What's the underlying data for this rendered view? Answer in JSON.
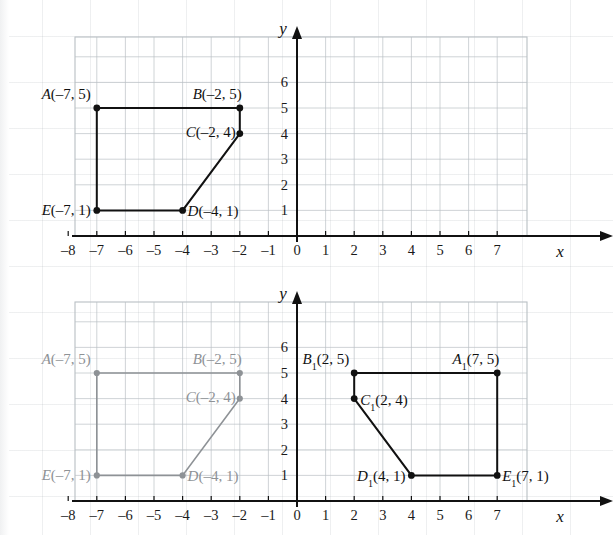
{
  "figure": {
    "kind": "coordinate-geometry-figure"
  },
  "chart_data": [
    {
      "id": "top-graph",
      "type": "scatter",
      "title": "",
      "xlabel": "x",
      "ylabel": "y",
      "xlim": [
        -8,
        7.6
      ],
      "ylim": [
        0,
        6.7
      ],
      "xticks": [
        "-8",
        "-7",
        "-6",
        "-5",
        "-4",
        "-3",
        "-2",
        "-1",
        "0",
        "1",
        "2",
        "3",
        "4",
        "5",
        "6",
        "7"
      ],
      "yticks": [
        "1",
        "2",
        "3",
        "4",
        "5",
        "6"
      ],
      "grid": true,
      "legend": "none",
      "series": [
        {
          "name": "pentagon-ABCDE",
          "color": "#111111",
          "closed": true,
          "points": [
            {
              "label": "A",
              "sub": "",
              "x": -7,
              "y": 5,
              "text": "A(–7, 5)",
              "anchor": "end",
              "dx": -6,
              "dy": -9
            },
            {
              "label": "B",
              "sub": "",
              "x": -2,
              "y": 5,
              "text": "B(–2, 5)",
              "anchor": "end",
              "dx": 2,
              "dy": -9
            },
            {
              "label": "C",
              "sub": "",
              "x": -2,
              "y": 4,
              "text": "C(–2, 4)",
              "anchor": "end",
              "dx": -4,
              "dy": 3
            },
            {
              "label": "D",
              "sub": "",
              "x": -4,
              "y": 1,
              "text": "D(–4, 1)",
              "anchor": "start",
              "dx": 5,
              "dy": 6
            },
            {
              "label": "E",
              "sub": "",
              "x": -7,
              "y": 1,
              "text": "E(–7, 1)",
              "anchor": "end",
              "dx": -6,
              "dy": 5
            }
          ]
        }
      ]
    },
    {
      "id": "bottom-graph",
      "type": "scatter",
      "title": "",
      "xlabel": "x",
      "ylabel": "y",
      "xlim": [
        -8,
        7.6
      ],
      "ylim": [
        0,
        6.7
      ],
      "xticks": [
        "-8",
        "-7",
        "-6",
        "-5",
        "-4",
        "-3",
        "-2",
        "-1",
        "0",
        "1",
        "2",
        "3",
        "4",
        "5",
        "6",
        "7"
      ],
      "yticks": [
        "1",
        "2",
        "3",
        "4",
        "5",
        "6"
      ],
      "grid": true,
      "legend": "none",
      "series": [
        {
          "name": "pentagon-ABCDE-preimage",
          "color": "#8e9296",
          "closed": true,
          "faded": true,
          "points": [
            {
              "label": "A",
              "sub": "",
              "x": -7,
              "y": 5,
              "text": "A(–7, 5)",
              "anchor": "end",
              "dx": -6,
              "dy": -9
            },
            {
              "label": "B",
              "sub": "",
              "x": -2,
              "y": 5,
              "text": "B(–2, 5)",
              "anchor": "end",
              "dx": 2,
              "dy": -9
            },
            {
              "label": "C",
              "sub": "",
              "x": -2,
              "y": 4,
              "text": "C(–2, 4)",
              "anchor": "end",
              "dx": -4,
              "dy": 3
            },
            {
              "label": "D",
              "sub": "",
              "x": -4,
              "y": 1,
              "text": "D(–4, 1)",
              "anchor": "start",
              "dx": 5,
              "dy": 6
            },
            {
              "label": "E",
              "sub": "",
              "x": -7,
              "y": 1,
              "text": "E(–7, 1)",
              "anchor": "end",
              "dx": -6,
              "dy": 5
            }
          ]
        },
        {
          "name": "pentagon-A1B1C1D1E1-image",
          "color": "#111111",
          "closed": true,
          "faded": false,
          "points": [
            {
              "label": "A",
              "sub": "1",
              "x": 7,
              "y": 5,
              "pre": "A",
              "post": "(7, 5)",
              "anchor": "end",
              "dx": 2,
              "dy": -9
            },
            {
              "label": "B",
              "sub": "1",
              "x": 2,
              "y": 5,
              "pre": "B",
              "post": "(2, 5)",
              "anchor": "end",
              "dx": -5,
              "dy": -9
            },
            {
              "label": "C",
              "sub": "1",
              "x": 2,
              "y": 4,
              "pre": "C",
              "post": "(2, 4)",
              "anchor": "start",
              "dx": 6,
              "dy": 6
            },
            {
              "label": "D",
              "sub": "1",
              "x": 4,
              "y": 1,
              "pre": "D",
              "post": "(4, 1)",
              "anchor": "end",
              "dx": -6,
              "dy": 6
            },
            {
              "label": "E",
              "sub": "1",
              "x": 7,
              "y": 1,
              "pre": "E",
              "post": "(7, 1)",
              "anchor": "start",
              "dx": 5,
              "dy": 6
            }
          ]
        }
      ]
    }
  ],
  "axis": {
    "x_name": "x",
    "y_name": "y",
    "x_tick_labels": [
      "–8",
      "–7",
      "–6",
      "–5",
      "–4",
      "–3",
      "–2",
      "–1",
      "0",
      "1",
      "2",
      "3",
      "4",
      "5",
      "6",
      "7"
    ],
    "y_tick_labels": [
      "6",
      "5",
      "4",
      "3",
      "2",
      "1"
    ]
  },
  "colors": {
    "ink": "#111111",
    "faded_ink": "#8e9296",
    "grid": "#b9bfc4",
    "paper": "#ffffff"
  }
}
